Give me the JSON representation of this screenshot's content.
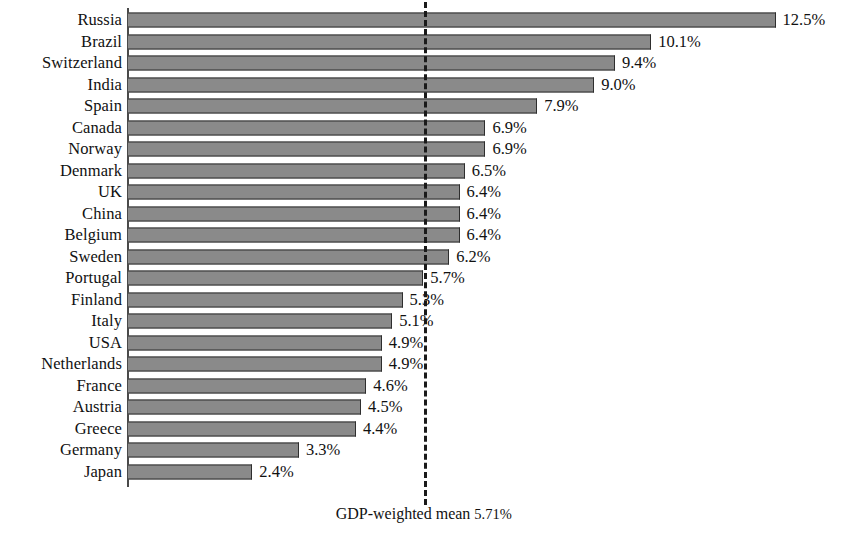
{
  "chart_data": {
    "type": "bar",
    "orientation": "horizontal",
    "title": "",
    "subtitle": "",
    "xlabel": "",
    "ylabel": "",
    "xlim": [
      0,
      13.9
    ],
    "grid": false,
    "legend": null,
    "value_label_format": "{v}%",
    "categories": [
      "Russia",
      "Brazil",
      "Switzerland",
      "India",
      "Spain",
      "Canada",
      "Norway",
      "Denmark",
      "UK",
      "China",
      "Belgium",
      "Sweden",
      "Portugal",
      "Finland",
      "Italy",
      "USA",
      "Netherlands",
      "France",
      "Austria",
      "Greece",
      "Germany",
      "Japan"
    ],
    "values": [
      12.5,
      10.1,
      9.4,
      9.0,
      7.9,
      6.9,
      6.9,
      6.5,
      6.4,
      6.4,
      6.4,
      6.2,
      5.7,
      5.3,
      5.1,
      4.9,
      4.9,
      4.6,
      4.5,
      4.4,
      3.3,
      2.4
    ],
    "value_labels": [
      "12.5%",
      "10.1%",
      "9.4%",
      "9.0%",
      "7.9%",
      "6.9%",
      "6.9%",
      "6.5%",
      "6.4%",
      "6.4%",
      "6.4%",
      "6.2%",
      "5.7%",
      "5.3%",
      "5.1%",
      "4.9%",
      "4.9%",
      "4.6%",
      "4.5%",
      "4.4%",
      "3.3%",
      "2.4%"
    ],
    "annotations": [
      {
        "name": "gdp-weighted-mean",
        "kind": "vertical-reference-line",
        "value": 5.71,
        "style": "dashed",
        "text": "GDP-weighted mean 5.71%",
        "text_main": "GDP-weighted mean",
        "text_value": "5.71%"
      }
    ],
    "colors": {
      "bar_fill": "#8a8a8a",
      "bar_edge": "#2e2e2e",
      "axis": "#4a4a4a",
      "reference_line": "#1a1a1a",
      "text": "#111111",
      "background": "#ffffff"
    }
  }
}
